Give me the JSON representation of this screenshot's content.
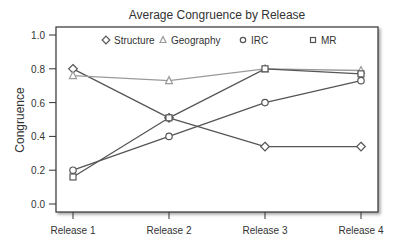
{
  "chart_data": {
    "type": "line",
    "title": "Average Congruence by Release",
    "xlabel": "",
    "ylabel": "Congruence",
    "categories": [
      "Release 1",
      "Release 2",
      "Release 3",
      "Release 4"
    ],
    "ylim": [
      0.0,
      1.0
    ],
    "yticks": [
      "0.0",
      "0.2",
      "0.4",
      "0.6",
      "0.8",
      "1.0"
    ],
    "grid": false,
    "legend_position": "top-inside",
    "series": [
      {
        "name": "Structure",
        "marker": "diamond",
        "color": "#555555",
        "values": [
          0.8,
          0.51,
          0.34,
          0.34
        ]
      },
      {
        "name": "Geography",
        "marker": "triangle",
        "color": "#9a9a9a",
        "values": [
          0.76,
          0.73,
          0.8,
          0.79
        ]
      },
      {
        "name": "IRC",
        "marker": "circle",
        "color": "#555555",
        "values": [
          0.2,
          0.4,
          0.6,
          0.73
        ]
      },
      {
        "name": "MR",
        "marker": "square",
        "color": "#555555",
        "values": [
          0.16,
          0.51,
          0.8,
          0.77
        ]
      }
    ]
  }
}
